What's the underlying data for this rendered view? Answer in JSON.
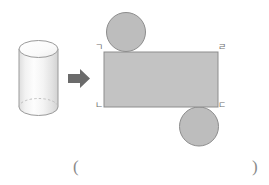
{
  "page": {
    "background_color": "#ffffff",
    "width": 269,
    "height": 185
  },
  "solid": {
    "name": "cylinder",
    "body_fill_light": "#fdfdfd",
    "body_fill_mid": "#e9e9e9",
    "body_fill_shadow": "#d6d6d6",
    "top_face_fill": "#fbfbfb",
    "outline_color": "#9a9a9a",
    "hidden_edge_color": "#b9b9b9",
    "hidden_edge_style": "dashed"
  },
  "arrow": {
    "name": "transform-arrow",
    "direction": "right",
    "fill": "#6b6b6b"
  },
  "net": {
    "name": "cylinder-net",
    "rectangle": {
      "label": "lateral-surface",
      "fill": "#c3c3c3",
      "stroke": "#8d8d8d"
    },
    "circles": [
      {
        "label": "top-base",
        "position": "above-top-edge",
        "fill": "#bdbdbd",
        "stroke": "#8d8d8d"
      },
      {
        "label": "bottom-base",
        "position": "below-bottom-edge",
        "fill": "#bdbdbd",
        "stroke": "#8d8d8d"
      }
    ],
    "vertex_labels": {
      "top_left": "ㄱ",
      "top_right": "ㄹ",
      "bottom_left": "ㄴ",
      "bottom_right": "ㄷ"
    }
  },
  "answer_blank": {
    "open": "(",
    "close": ")"
  }
}
